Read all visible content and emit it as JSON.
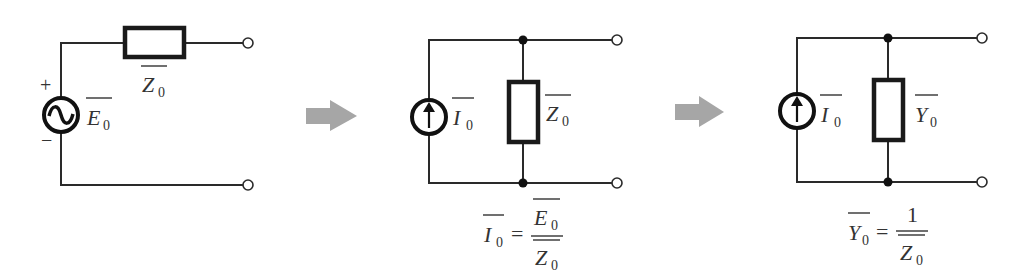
{
  "diagram": {
    "colors": {
      "wire": "#2a2a2a",
      "component": "#1a1a1a",
      "arrow": "#a6a6a6",
      "text": "#333333",
      "background": "#ffffff"
    },
    "circuit1": {
      "type": "series voltage source with impedance",
      "source": {
        "kind": "AC voltage source",
        "symbol": "~",
        "label": "E",
        "subscript": "0",
        "plus": "+",
        "minus": "−"
      },
      "impedance": {
        "label": "Z",
        "subscript": "0",
        "orientation": "horizontal"
      }
    },
    "arrow1": {
      "direction": "right"
    },
    "circuit2": {
      "type": "parallel current source with impedance",
      "source": {
        "kind": "current source",
        "symbol": "↑",
        "label": "I",
        "subscript": "0"
      },
      "impedance": {
        "label": "Z",
        "subscript": "0",
        "orientation": "vertical"
      },
      "formula": {
        "lhs": "I",
        "lhs_sub": "0",
        "eq": "=",
        "num": "E",
        "num_sub": "0",
        "den": "Z",
        "den_sub": "0"
      }
    },
    "arrow2": {
      "direction": "right"
    },
    "circuit3": {
      "type": "parallel current source with admittance",
      "source": {
        "kind": "current source",
        "symbol": "↑",
        "label": "I",
        "subscript": "0"
      },
      "admittance": {
        "label": "Y",
        "subscript": "0",
        "orientation": "vertical"
      },
      "formula": {
        "lhs": "Y",
        "lhs_sub": "0",
        "eq": "=",
        "num": "1",
        "den": "Z",
        "den_sub": "0"
      }
    }
  }
}
